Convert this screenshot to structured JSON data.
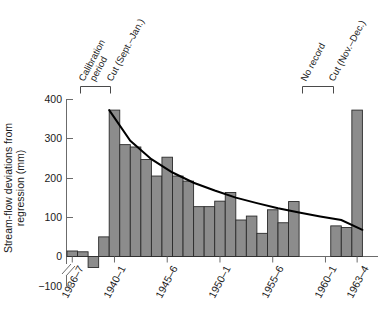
{
  "chart_data": {
    "type": "bar",
    "title": "",
    "subtitle": "",
    "xlabel": "",
    "ylabel": "Stream-flow deviations from regression (mm)",
    "ylabel_lines": [
      "Stream-flow deviations from",
      "regression (mm)"
    ],
    "ylim": [
      -100,
      400
    ],
    "y_ticks": [
      -100,
      0,
      100,
      200,
      300,
      400
    ],
    "y_tick_labels": [
      "−100",
      "0",
      "100",
      "200",
      "300",
      "400"
    ],
    "y_axis_break": true,
    "grid": false,
    "legend": null,
    "bar_color": "#8c8c8c",
    "bar_edge_color": "#2b2b2b",
    "trend_color": "#000000",
    "x_tick_labels": [
      "1936–7",
      "1940–1",
      "1945–6",
      "1950–1",
      "1955–6",
      "1960–1",
      "1963–4"
    ],
    "x_tick_years": [
      "1936-7",
      "1940-1",
      "1945-6",
      "1950-1",
      "1955-6",
      "1960-1",
      "1963-4"
    ],
    "categories": [
      "1936-7",
      "1937-8",
      "1938-9",
      "1939-40",
      "1940-1",
      "1941-2",
      "1942-3",
      "1943-4",
      "1944-5",
      "1945-6",
      "1946-7",
      "1947-8",
      "1948-9",
      "1949-50",
      "1950-1",
      "1951-2",
      "1952-3",
      "1953-4",
      "1954-5",
      "1955-6",
      "1956-7",
      "1957-8",
      "1958-9",
      "1959-60",
      "1960-1",
      "1961-2",
      "1962-3",
      "1963-4"
    ],
    "values": [
      14,
      12,
      -28,
      50,
      373,
      285,
      279,
      247,
      205,
      253,
      205,
      192,
      127,
      127,
      141,
      163,
      93,
      103,
      59,
      119,
      86,
      140,
      null,
      null,
      null,
      78,
      74,
      373
    ],
    "missing_label": "No record",
    "series": [
      {
        "name": "Stream-flow deviation",
        "values": [
          14,
          12,
          -28,
          50,
          373,
          285,
          279,
          247,
          205,
          253,
          205,
          192,
          127,
          127,
          141,
          163,
          93,
          103,
          59,
          119,
          86,
          140,
          null,
          null,
          null,
          78,
          74,
          373
        ]
      },
      {
        "name": "Fitted decay curve",
        "type": "line",
        "x": [
          4.0,
          6,
          8,
          10,
          12,
          14,
          16,
          18,
          20,
          22,
          24,
          26,
          28
        ],
        "y": [
          373,
          295,
          248,
          214,
          188,
          168,
          150,
          136,
          123,
          112,
          102,
          93,
          68
        ]
      }
    ],
    "annotations": [
      {
        "id": "calibration-period",
        "text": "Calibration period",
        "lines": [
          "Calibration",
          "period"
        ],
        "bracket": true
      },
      {
        "id": "cut-sept-jan",
        "text": "Cut (Sept.–Jan.)",
        "lines": [
          "Cut (Sept.–Jan.)"
        ],
        "bracket": false
      },
      {
        "id": "no-record",
        "text": "No record",
        "lines": [
          "No record"
        ],
        "bracket": true
      },
      {
        "id": "cut-nov-dec",
        "text": "Cut (Nov.–Dec.)",
        "lines": [
          "Cut (Nov.–Dec.)"
        ],
        "bracket": false
      }
    ]
  },
  "labels": {
    "y_axis_line1": "Stream-flow deviations from",
    "y_axis_line2": "regression (mm)",
    "y400": "400",
    "y300": "300",
    "y200": "200",
    "y100": "100",
    "y0": "0",
    "yneg100": "−100",
    "x1": "1936–7",
    "x2": "1940–1",
    "x3": "1945–6",
    "x4": "1950–1",
    "x5": "1955–6",
    "x6": "1960–1",
    "x7": "1963–4",
    "annot_calibration_1": "Calibration",
    "annot_calibration_2": "period",
    "annot_cut_sept": "Cut (Sept.–Jan.)",
    "annot_no_record": "No record",
    "annot_cut_nov": "Cut (Nov.–Dec.)"
  }
}
